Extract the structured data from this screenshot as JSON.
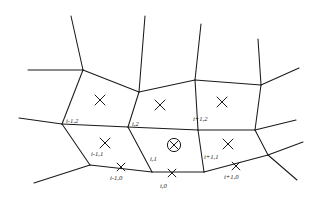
{
  "figure": {
    "kind": "polygonal-mesh-diagram",
    "width": 312,
    "height": 197,
    "background_color": "#ffffff",
    "line_color": "#1a1a1a"
  },
  "cell_labels": [
    {
      "id": "cell-im1-2",
      "text": "i-1,2",
      "x": 66,
      "y": 123
    },
    {
      "id": "cell-i-2",
      "text": "i,2",
      "x": 132,
      "y": 126
    },
    {
      "id": "cell-ip1-2",
      "text": "i+1,2",
      "x": 193,
      "y": 121
    },
    {
      "id": "cell-im1-1",
      "text": "i-1,1",
      "x": 91,
      "y": 156
    },
    {
      "id": "cell-i-1",
      "text": "i,1",
      "x": 150,
      "y": 161
    },
    {
      "id": "cell-ip1-1",
      "text": "i+1,1",
      "x": 204,
      "y": 159
    }
  ],
  "node_labels": [
    {
      "id": "node-im1-0",
      "text": "i-1,0",
      "x": 110,
      "y": 180
    },
    {
      "id": "node-i-0",
      "text": "i,0",
      "x": 160,
      "y": 188
    },
    {
      "id": "node-ip1-0",
      "text": "i+1,0",
      "x": 224,
      "y": 179
    }
  ],
  "cell_center_markers": [
    {
      "id": "center-im1-2",
      "symbol": "x",
      "x": 100,
      "y": 100,
      "size": 5.0
    },
    {
      "id": "center-i-2",
      "symbol": "x",
      "x": 160,
      "y": 105,
      "size": 5.0
    },
    {
      "id": "center-ip1-2",
      "symbol": "x",
      "x": 222,
      "y": 102,
      "size": 5.0
    },
    {
      "id": "center-im1-1",
      "symbol": "x",
      "x": 105,
      "y": 143,
      "size": 5.0
    },
    {
      "id": "center-i-1",
      "symbol": "circled-x",
      "x": 174,
      "y": 145,
      "size": 4.3,
      "radius": 6.6
    },
    {
      "id": "center-ip1-1",
      "symbol": "x",
      "x": 228,
      "y": 144,
      "size": 5.0
    }
  ],
  "boundary_node_markers": [
    {
      "id": "bnode-im1-0",
      "symbol": "x",
      "x": 121,
      "y": 167,
      "size": 3.9
    },
    {
      "id": "bnode-i-0",
      "symbol": "x",
      "x": 172,
      "y": 173,
      "size": 3.9
    },
    {
      "id": "bnode-ip1-0",
      "symbol": "x",
      "x": 236,
      "y": 166,
      "size": 3.9
    }
  ],
  "edges": [
    {
      "id": "edge-top-left-spur",
      "points": "71,16 83,70"
    },
    {
      "id": "edge-left-upper-arm",
      "points": "28,70 83,70"
    },
    {
      "id": "edge-upper-left-to-mid",
      "points": "83,70 139,92"
    },
    {
      "id": "edge-mid-top-spur",
      "points": "145,16 139,92"
    },
    {
      "id": "edge-mid-to-right",
      "points": "139,92 195,80"
    },
    {
      "id": "edge-right-top-spur",
      "points": "201,24 195,80"
    },
    {
      "id": "edge-right-to-far",
      "points": "195,80 261,85"
    },
    {
      "id": "edge-far-top-spur",
      "points": "258,39 261,85"
    },
    {
      "id": "edge-far-right-arm",
      "points": "261,85 299,68"
    },
    {
      "id": "edge-left-mid-vertical",
      "points": "83,70 62,124"
    },
    {
      "id": "edge-left-mid-arm",
      "points": "19,118 62,124"
    },
    {
      "id": "edge-mid-horizontal-1",
      "points": "62,124 128,127"
    },
    {
      "id": "edge-mid-vertical-2",
      "points": "139,92 128,127"
    },
    {
      "id": "edge-mid-horizontal-2",
      "points": "128,127 198,130"
    },
    {
      "id": "edge-mid-vertical-3",
      "points": "195,80 198,130"
    },
    {
      "id": "edge-mid-horizontal-3",
      "points": "198,130 255,130"
    },
    {
      "id": "edge-right-mid-vertical",
      "points": "261,85 255,130"
    },
    {
      "id": "edge-right-mid-arm",
      "points": "255,130 296,120"
    },
    {
      "id": "edge-lower-left-vert",
      "points": "62,124 90,165"
    },
    {
      "id": "edge-lower-left-arm",
      "points": "34,183 90,165"
    },
    {
      "id": "edge-bottom-1",
      "points": "90,165 152,172"
    },
    {
      "id": "edge-lower-mid-vert",
      "points": "128,127 152,172"
    },
    {
      "id": "edge-bottom-2",
      "points": "152,172 204,172"
    },
    {
      "id": "edge-lower-mid-vert-2",
      "points": "198,130 204,172"
    },
    {
      "id": "edge-bottom-3",
      "points": "204,172 268,155"
    },
    {
      "id": "edge-lower-right-vert",
      "points": "255,130 268,155"
    },
    {
      "id": "edge-lower-right-arm-1",
      "points": "268,155 303,142"
    },
    {
      "id": "edge-lower-right-arm-2",
      "points": "268,155 297,180"
    }
  ]
}
